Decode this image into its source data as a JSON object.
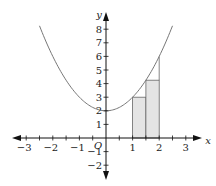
{
  "chart_data": {
    "type": "line",
    "title": "",
    "function": "y = x^2 + 2",
    "curve_x_range": [
      -2.5,
      2.5
    ],
    "xlabel": "x",
    "ylabel": "y",
    "origin_label": "O",
    "xlim": [
      -3.4,
      3.4
    ],
    "ylim": [
      -2.9,
      8.9
    ],
    "x_ticks": [
      -3,
      -2,
      -1,
      1,
      2,
      3
    ],
    "x_minor_step": 0.5,
    "y_ticks": [
      -2,
      -1,
      1,
      2,
      3,
      4,
      5,
      6,
      7,
      8
    ],
    "grid": false,
    "rectangles": [
      {
        "x0": 1.0,
        "x1": 1.5,
        "height": 3.0,
        "fill": "#e4e4e4"
      },
      {
        "x0": 1.5,
        "x1": 2.0,
        "height": 4.25,
        "fill": "#e4e4e4"
      }
    ],
    "vertical_line": {
      "x": 2,
      "y_from": 4.25,
      "y_to": 6
    },
    "colors": {
      "axis": "#111111",
      "curve": "#777777",
      "rect_stroke": "#666666"
    }
  },
  "layout": {
    "origin_px": [
      106,
      138
    ],
    "x_scale": 26.6,
    "y_scale": 13.6
  }
}
